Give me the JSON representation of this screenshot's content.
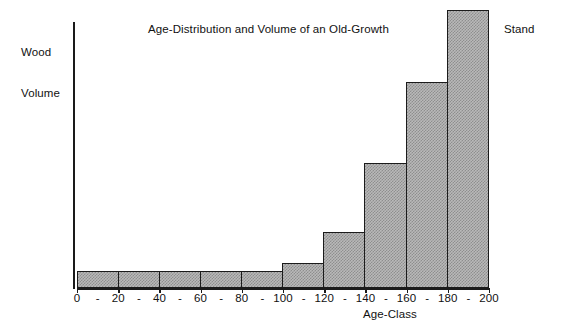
{
  "chart_data": {
    "type": "bar",
    "title": "Age-Distribution and Volume of an Old-Growth",
    "title_tail": "Stand",
    "full_title": "Age-Distribution and Volume of an Old-Growth Stand",
    "xlabel": "Age-Class",
    "ylabel_line1": "Wood",
    "ylabel_line2": "Volume",
    "ylabel": "Wood Volume",
    "grid": false,
    "legend": "none",
    "xlim": [
      0,
      200
    ],
    "ylim": [
      0,
      100
    ],
    "bin_width": 20,
    "tick_labels": [
      "0",
      "20",
      "40",
      "60",
      "80",
      "100",
      "120",
      "140",
      "160",
      "180",
      "200"
    ],
    "tick_separator": "-",
    "categories": [
      "0 - 20",
      "20 - 40",
      "40 - 60",
      "60 - 80",
      "80 - 100",
      "100 - 120",
      "120 - 140",
      "140 - 160",
      "160 - 180",
      "180 - 200"
    ],
    "values": [
      6,
      6,
      6,
      6,
      6,
      9,
      20,
      45,
      74,
      100
    ],
    "bar_fill_color": "#b9b9b9",
    "bar_edge_color": "#1b1b1b",
    "axis_color": "#1b1b1b",
    "background_color": "#ffffff"
  }
}
